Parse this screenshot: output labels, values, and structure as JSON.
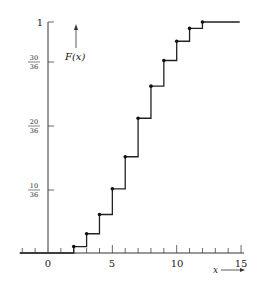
{
  "chart_data": {
    "type": "line",
    "subtype": "step",
    "title": "",
    "ylabel": "F(x)",
    "xlabel": "x",
    "xlim": [
      -2,
      15
    ],
    "ylim": [
      0,
      1
    ],
    "x_ticks": [
      0,
      5,
      10,
      15
    ],
    "x_tick_labels": [
      "0",
      "5",
      "10",
      "15"
    ],
    "y_ticks": [
      10,
      20,
      30,
      36
    ],
    "y_tick_labels": [
      "10/36",
      "20/36",
      "30/36",
      "1"
    ],
    "x": [
      2,
      3,
      4,
      5,
      6,
      7,
      8,
      9,
      10,
      11,
      12
    ],
    "values_over_36": [
      1,
      3,
      6,
      10,
      15,
      21,
      26,
      30,
      33,
      35,
      36
    ],
    "values": [
      0.0278,
      0.0833,
      0.1667,
      0.2778,
      0.4167,
      0.5833,
      0.7222,
      0.8333,
      0.9167,
      0.9722,
      1.0
    ],
    "grid": false,
    "legend": null
  },
  "labels": {
    "y_axis": "F(x)",
    "x_axis": "x",
    "x0": "0",
    "x5": "5",
    "x10": "10",
    "x15": "15",
    "y1": "1",
    "y30_num": "30",
    "y30_den": "36",
    "y20_num": "20",
    "y20_den": "36",
    "y10_num": "10",
    "y10_den": "36"
  }
}
